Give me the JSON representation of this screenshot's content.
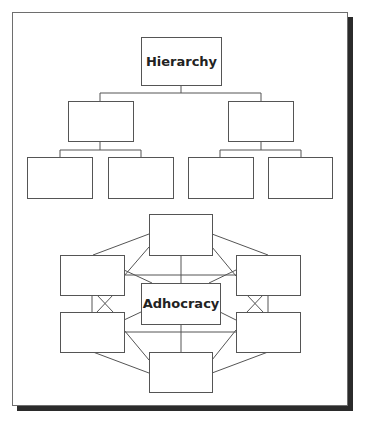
{
  "diagram": {
    "hierarchy": {
      "title": "Hierarchy",
      "levels": [
        {
          "level": 1,
          "boxes": 1,
          "labels": [
            "Hierarchy"
          ]
        },
        {
          "level": 2,
          "boxes": 2,
          "labels": [
            "",
            ""
          ]
        },
        {
          "level": 3,
          "boxes": 4,
          "labels": [
            "",
            "",
            "",
            ""
          ]
        }
      ]
    },
    "adhocracy": {
      "title": "Adhocracy",
      "center_label": "Adhocracy",
      "peripheral_boxes": 6,
      "description": "Center box linked to six surrounding boxes, all interconnected"
    }
  },
  "colors": {
    "stroke": "#555555",
    "shadow": "#2b2b2b",
    "background": "#ffffff",
    "text": "#222222"
  }
}
